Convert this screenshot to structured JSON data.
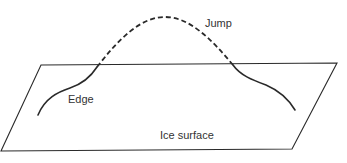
{
  "diagram": {
    "labels": {
      "jump": "Jump",
      "edge": "Edge",
      "surface": "Ice surface"
    },
    "colors": {
      "stroke": "#2a2a2a",
      "text": "#333333",
      "background": "#ffffff"
    },
    "elements": [
      {
        "id": "ice-surface",
        "type": "parallelogram",
        "label": "Ice surface"
      },
      {
        "id": "edge-curve-left",
        "type": "solid-curve",
        "label": "Edge"
      },
      {
        "id": "jump-arc",
        "type": "dashed-curve",
        "label": "Jump"
      },
      {
        "id": "edge-curve-right",
        "type": "solid-curve"
      }
    ]
  }
}
